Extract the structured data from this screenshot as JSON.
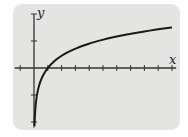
{
  "chart_data": {
    "type": "line",
    "title": "",
    "xlabel": "x",
    "ylabel": "y",
    "function": "logarithmic curve y = log(x), vertical asymptote at x = 0, x-intercept at x = 1",
    "series": [
      {
        "name": "y = log x",
        "x": [
          0.05,
          0.1,
          0.25,
          0.5,
          1,
          2,
          3,
          4,
          5,
          6,
          7,
          8,
          9,
          10
        ],
        "values": [
          -2.0,
          -1.5,
          -0.9,
          -0.45,
          0,
          0.45,
          0.71,
          0.9,
          1.05,
          1.16,
          1.26,
          1.35,
          1.43,
          1.5
        ]
      }
    ],
    "xlim": [
      -1.4,
      10.3
    ],
    "ylim": [
      -2.2,
      2.0
    ],
    "x_ticks": [
      -1,
      0,
      1,
      2,
      3,
      4,
      5,
      6,
      7,
      8,
      9,
      10
    ],
    "y_ticks": [
      -2,
      -1,
      0,
      1,
      2
    ],
    "tick_labels_shown": false,
    "grid": false,
    "legend": "none",
    "colors": {
      "panel": "#e4e4e2",
      "axis": "#333333",
      "curve": "#1a1a1a"
    }
  }
}
